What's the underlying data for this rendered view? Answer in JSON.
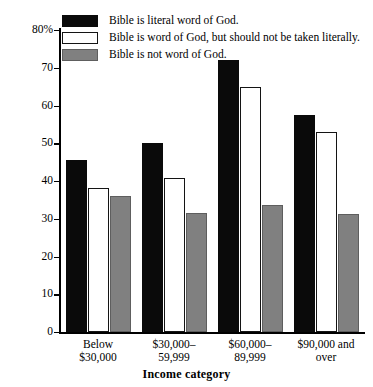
{
  "chart_data": {
    "type": "bar",
    "title": "",
    "xlabel": "Income category",
    "ylabel": "",
    "ylim": [
      0,
      80
    ],
    "yticks": [
      0,
      10,
      20,
      30,
      40,
      50,
      60,
      70,
      80
    ],
    "ytick_labels": [
      "0",
      "10",
      "20",
      "30",
      "40",
      "50",
      "60",
      "70",
      "80%"
    ],
    "grid": false,
    "legend_position": "top-left",
    "categories": [
      "Below\n$30,000",
      "$30,000–\n59,999",
      "$60,000–\n89,999",
      "$90,000 and\nover"
    ],
    "series": [
      {
        "name": "Bible is literal word of God.",
        "color": "#0a0a0a",
        "values": [
          45.6,
          50.1,
          72.0,
          57.5
        ]
      },
      {
        "name": "Bible is word of God, but should not be taken literally.",
        "color": "#ffffff",
        "values": [
          38.1,
          40.8,
          64.9,
          53.0
        ]
      },
      {
        "name": "Bible is not word of God.",
        "color": "#808080",
        "values": [
          36.0,
          31.5,
          33.6,
          31.3
        ]
      }
    ]
  }
}
